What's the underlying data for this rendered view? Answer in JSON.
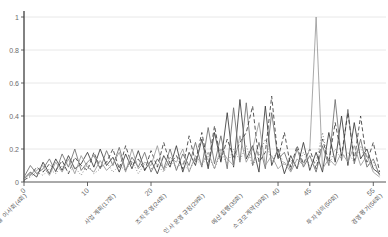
{
  "chart_data": {
    "type": "line",
    "title": "",
    "xlabel": "",
    "ylabel": "",
    "ylim": [
      0,
      1
    ],
    "xlim": [
      0,
      57
    ],
    "grid": true,
    "legend": "none",
    "ytick_labels": [
      "0",
      "0.2",
      "0.4",
      "0.6",
      "0.8",
      "1"
    ],
    "ytick_values": [
      0,
      0.2,
      0.4,
      0.6,
      0.8,
      1
    ],
    "xtick_labels": [
      "0",
      "10",
      "20",
      "40",
      "45",
      "55"
    ],
    "xtick_values": [
      0,
      10,
      20,
      40,
      45,
      55
    ],
    "x_category_labels": [
      {
        "x": 0,
        "text": "월별 이사회(4회)"
      },
      {
        "x": 14,
        "text": "사업계획(17회)"
      },
      {
        "x": 22,
        "text": "조직운영(24회)"
      },
      {
        "x": 28,
        "text": "인사 운영규정(29회)"
      },
      {
        "x": 34,
        "text": "예산집행(35회)"
      },
      {
        "x": 38,
        "text": "소규모계약(39회)"
      },
      {
        "x": 49,
        "text": "투자심의(50회)"
      },
      {
        "x": 56,
        "text": "경영평가(56회)"
      }
    ],
    "colors": {
      "axis": "#555555",
      "grid": "#e8e8e8",
      "series_dark": "#3a3a3a",
      "series_mid": "#6e6e6e",
      "series_light": "#9a9a9a",
      "background": "#ffffff"
    },
    "series": [
      {
        "name": "series-1",
        "style": "solid",
        "color": "#3a3a3a",
        "values": [
          0.02,
          0.06,
          0.03,
          0.12,
          0.05,
          0.14,
          0.07,
          0.16,
          0.08,
          0.11,
          0.18,
          0.09,
          0.2,
          0.1,
          0.15,
          0.06,
          0.17,
          0.08,
          0.19,
          0.07,
          0.13,
          0.05,
          0.16,
          0.09,
          0.22,
          0.06,
          0.18,
          0.1,
          0.26,
          0.08,
          0.3,
          0.12,
          0.42,
          0.09,
          0.5,
          0.14,
          0.22,
          0.06,
          0.46,
          0.1,
          0.2,
          0.05,
          0.16,
          0.08,
          0.24,
          0.07,
          0.18,
          0.06,
          0.3,
          0.12,
          0.4,
          0.1,
          0.36,
          0.14,
          0.2,
          0.08,
          0.05
        ]
      },
      {
        "name": "series-2",
        "style": "solid",
        "color": "#6e6e6e",
        "values": [
          0.03,
          0.1,
          0.05,
          0.08,
          0.14,
          0.06,
          0.17,
          0.09,
          0.2,
          0.07,
          0.12,
          0.16,
          0.08,
          0.19,
          0.1,
          0.21,
          0.07,
          0.15,
          0.09,
          0.18,
          0.06,
          0.14,
          0.08,
          0.2,
          0.07,
          0.17,
          0.1,
          0.24,
          0.09,
          0.33,
          0.11,
          0.28,
          0.08,
          0.45,
          0.12,
          0.48,
          0.1,
          0.24,
          0.08,
          0.42,
          0.14,
          0.18,
          0.07,
          0.2,
          0.09,
          0.16,
          0.06,
          0.22,
          0.1,
          0.5,
          0.13,
          0.44,
          0.11,
          0.26,
          0.09,
          0.14,
          0.04
        ]
      },
      {
        "name": "series-3",
        "style": "dashed",
        "color": "#3a3a3a",
        "values": [
          0.01,
          0.04,
          0.09,
          0.06,
          0.11,
          0.07,
          0.13,
          0.05,
          0.15,
          0.1,
          0.07,
          0.18,
          0.09,
          0.12,
          0.2,
          0.08,
          0.22,
          0.1,
          0.14,
          0.07,
          0.19,
          0.09,
          0.24,
          0.11,
          0.16,
          0.08,
          0.28,
          0.12,
          0.3,
          0.1,
          0.34,
          0.13,
          0.26,
          0.15,
          0.24,
          0.3,
          0.46,
          0.12,
          0.18,
          0.52,
          0.14,
          0.3,
          0.09,
          0.22,
          0.11,
          0.2,
          0.08,
          0.26,
          0.12,
          0.36,
          0.16,
          0.42,
          0.13,
          0.4,
          0.12,
          0.24,
          0.06
        ]
      },
      {
        "name": "series-4",
        "style": "solid",
        "color": "#9a9a9a",
        "values": [
          0.02,
          0.05,
          0.07,
          0.1,
          0.04,
          0.12,
          0.06,
          0.14,
          0.05,
          0.16,
          0.09,
          0.06,
          0.13,
          0.07,
          0.11,
          0.18,
          0.06,
          0.2,
          0.08,
          0.12,
          0.1,
          0.22,
          0.07,
          0.15,
          0.12,
          0.2,
          0.06,
          0.16,
          0.11,
          0.18,
          0.08,
          0.2,
          0.14,
          0.1,
          0.28,
          0.12,
          0.2,
          0.36,
          0.1,
          0.16,
          0.08,
          0.12,
          0.06,
          0.14,
          0.1,
          0.2,
          1.0,
          0.08,
          0.14,
          0.1,
          0.18,
          0.12,
          0.22,
          0.1,
          0.16,
          0.06,
          0.03
        ]
      },
      {
        "name": "series-5",
        "style": "dotted",
        "color": "#7d7d7d",
        "values": [
          0.01,
          0.03,
          0.06,
          0.04,
          0.08,
          0.05,
          0.1,
          0.06,
          0.09,
          0.04,
          0.11,
          0.05,
          0.08,
          0.12,
          0.06,
          0.1,
          0.07,
          0.13,
          0.05,
          0.11,
          0.08,
          0.1,
          0.06,
          0.13,
          0.09,
          0.11,
          0.07,
          0.14,
          0.1,
          0.16,
          0.08,
          0.18,
          0.11,
          0.2,
          0.13,
          0.22,
          0.1,
          0.16,
          0.26,
          0.12,
          0.2,
          0.1,
          0.14,
          0.08,
          0.18,
          0.1,
          0.12,
          0.3,
          0.1,
          0.2,
          0.14,
          0.18,
          0.12,
          0.22,
          0.1,
          0.12,
          0.04
        ]
      }
    ]
  }
}
